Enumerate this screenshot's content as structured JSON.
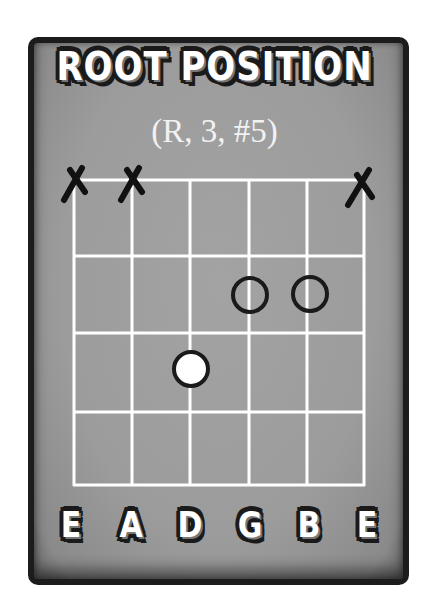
{
  "title": "ROOT POSITION",
  "subtitle": "(R, 3, #5)",
  "diagram": {
    "type": "guitar-chord-diagram",
    "strings": [
      "E",
      "A",
      "D",
      "G",
      "B",
      "E"
    ],
    "frets_shown": 4,
    "muted_strings": [
      "E (6th)",
      "A (5th)",
      "E (1st)"
    ],
    "markers": [
      {
        "string": "D",
        "fret": 3,
        "style": "filled-white",
        "role": "R"
      },
      {
        "string": "G",
        "fret": 2,
        "style": "open-circle",
        "role": "3"
      },
      {
        "string": "B",
        "fret": 2,
        "style": "open-circle",
        "role": "#5"
      }
    ]
  },
  "colors": {
    "card_bg": "#9e9e9e",
    "border": "#1c1c1c",
    "grid": "#ffffff",
    "marker_outline": "#1a1a1a"
  }
}
